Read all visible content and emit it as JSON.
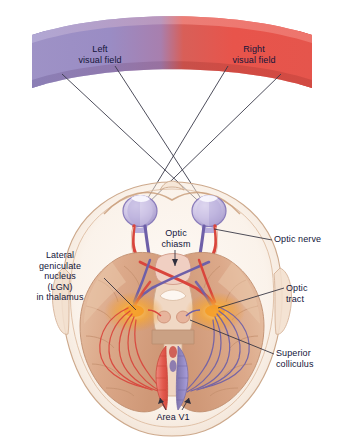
{
  "figure": {
    "view": "horizontal section through the head, viewed from above"
  },
  "labels": {
    "left_visual_field": "Left\nvisual field",
    "right_visual_field": "Right\nvisual field",
    "optic_chiasm": "Optic\nchiasm",
    "optic_nerve": "Optic nerve",
    "lgn": "Lateral\ngeniculate\nnucleus\n(LGN)\nin thalamus",
    "optic_tract": "Optic\ntract",
    "superior_colliculus": "Superior\ncolliculus",
    "area_v1": "Area V1"
  },
  "colors": {
    "left_field_purple": "#9a8cc4",
    "right_field_red": "#e8544b",
    "text_navy": "#13143a",
    "leader_line": "#3a3a4a",
    "brain_tan": "#d9a585",
    "brain_tan_light": "#e8c4a8",
    "skull_outline": "#c9a489",
    "lgn_glow_orange": "#f5a623",
    "v1_left_red": "#e2594d",
    "v1_right_purple": "#8f85bd",
    "eye_lavender": "#c5bce0",
    "nerve_red": "#d9453c",
    "nerve_purple": "#6e5fa8",
    "background": "#ffffff"
  },
  "banner": {
    "left_half_color": "#9a8cc4",
    "right_half_color": "#e8544b",
    "gradient_midpoint_pct": 50
  },
  "structures": [
    {
      "name": "left-eye",
      "cx": 140,
      "cy": 211
    },
    {
      "name": "right-eye",
      "cx": 209,
      "cy": 211
    },
    {
      "name": "optic-chiasm",
      "cx": 174,
      "cy": 268
    },
    {
      "name": "left-lgn",
      "cx": 134,
      "cy": 312
    },
    {
      "name": "right-lgn",
      "cx": 215,
      "cy": 312
    },
    {
      "name": "left-superior-colliculus",
      "cx": 163,
      "cy": 317
    },
    {
      "name": "right-superior-colliculus",
      "cx": 185,
      "cy": 317
    },
    {
      "name": "left-area-v1",
      "cx": 160,
      "cy": 372
    },
    {
      "name": "right-area-v1",
      "cx": 190,
      "cy": 372
    }
  ]
}
